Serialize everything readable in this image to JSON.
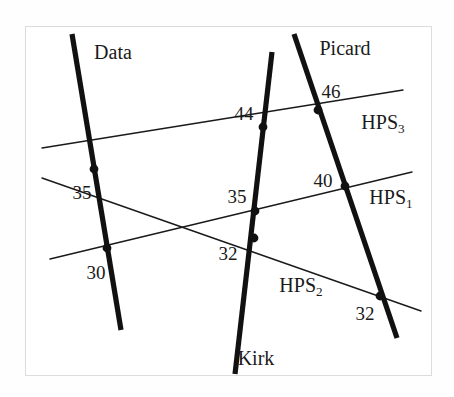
{
  "figure": {
    "background_color": "#ffffff",
    "frame_color": "#dcdcdc",
    "ink_color": "#111111"
  },
  "chart_data": {
    "type": "diagram",
    "title": "",
    "thick_lines": [
      {
        "name": "Data",
        "x1": 72,
        "y1": 34,
        "x2": 121,
        "y2": 330
      },
      {
        "name": "Kirk",
        "x1": 272,
        "y1": 52,
        "x2": 235,
        "y2": 374
      },
      {
        "name": "Picard",
        "x1": 294,
        "y1": 34,
        "x2": 397,
        "y2": 338
      }
    ],
    "thin_lines": [
      {
        "name": "HPS3",
        "label": "HPS",
        "subscript": "3",
        "x1": 42,
        "y1": 148,
        "x2": 403,
        "y2": 90
      },
      {
        "name": "HPS1",
        "label": "HPS",
        "subscript": "1",
        "x1": 50,
        "y1": 259,
        "x2": 412,
        "y2": 172
      },
      {
        "name": "HPS2",
        "label": "HPS",
        "subscript": "2",
        "x1": 42,
        "y1": 178,
        "x2": 421,
        "y2": 311
      }
    ],
    "intersections": [
      {
        "thick": "Data",
        "thin": "HPS3",
        "x": 94,
        "y": 169,
        "value": "35"
      },
      {
        "thick": "Data",
        "thin": "HPS1",
        "x": 107,
        "y": 248,
        "value": "30"
      },
      {
        "thick": "Kirk",
        "thin": "HPS3",
        "x": 263,
        "y": 127,
        "value": "44"
      },
      {
        "thick": "Kirk",
        "thin": "HPS1",
        "x": 255,
        "y": 211,
        "value": "35"
      },
      {
        "thick": "Kirk",
        "thin": "HPS2",
        "x": 254,
        "y": 238,
        "value": "32"
      },
      {
        "thick": "Picard",
        "thin": "HPS3",
        "x": 318,
        "y": 110,
        "value": "46"
      },
      {
        "thick": "Picard",
        "thin": "HPS1",
        "x": 345,
        "y": 186,
        "value": "40"
      },
      {
        "thick": "Picard",
        "thin": "HPS2",
        "x": 380,
        "y": 296,
        "value": "32"
      }
    ],
    "values": [
      "35",
      "30",
      "44",
      "35",
      "32",
      "46",
      "40",
      "32"
    ]
  },
  "labels": {
    "line_names": [
      {
        "id": "data-label",
        "text": "Data",
        "x": 113,
        "y": 52
      },
      {
        "id": "picard-label",
        "text": "Picard",
        "x": 345,
        "y": 48
      },
      {
        "id": "kirk-label",
        "text": "Kirk",
        "x": 256,
        "y": 358
      }
    ],
    "hps_names": [
      {
        "id": "hps3-label",
        "text": "HPS",
        "sub": "3",
        "x": 383,
        "y": 122
      },
      {
        "id": "hps1-label",
        "text": "HPS",
        "sub": "1",
        "x": 391,
        "y": 197
      },
      {
        "id": "hps2-label",
        "text": "HPS",
        "sub": "2",
        "x": 301,
        "y": 285
      }
    ],
    "values": [
      {
        "id": "value-data-hps3",
        "text": "35",
        "x": 82,
        "y": 192
      },
      {
        "id": "value-data-hps1",
        "text": "30",
        "x": 96,
        "y": 272
      },
      {
        "id": "value-kirk-hps3",
        "text": "44",
        "x": 244,
        "y": 113
      },
      {
        "id": "value-kirk-hps1",
        "text": "35",
        "x": 237,
        "y": 196
      },
      {
        "id": "value-kirk-hps2",
        "text": "32",
        "x": 228,
        "y": 253
      },
      {
        "id": "value-picard-hps3",
        "text": "46",
        "x": 331,
        "y": 91
      },
      {
        "id": "value-picard-hps1",
        "text": "40",
        "x": 323,
        "y": 180
      },
      {
        "id": "value-picard-hps2",
        "text": "32",
        "x": 365,
        "y": 313
      }
    ]
  }
}
